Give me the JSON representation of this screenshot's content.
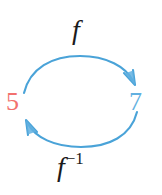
{
  "figure": {
    "background_color": "#ffffff",
    "arc_color": "#4aa3d8",
    "nodes": [
      {
        "id": "domain",
        "text": "5",
        "color": "#f2716e",
        "x": 18,
        "y": 104
      },
      {
        "id": "codomain",
        "text": "7",
        "color": "#62b0e0",
        "x": 139,
        "y": 104
      }
    ],
    "arrows": [
      {
        "id": "forward",
        "label": "f",
        "label_color": "#1b1b1b",
        "from": "domain",
        "to": "codomain",
        "direction": "clockwise-top",
        "color": "#4aa3d8"
      },
      {
        "id": "inverse",
        "label_base": "f",
        "label_exponent": "−1",
        "label_color": "#1b1b1b",
        "from": "codomain",
        "to": "domain",
        "direction": "counterclockwise-bottom",
        "color": "#4aa3d8"
      }
    ]
  }
}
